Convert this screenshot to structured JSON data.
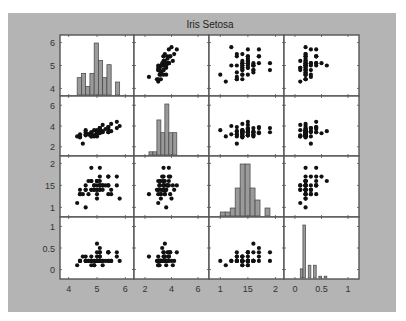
{
  "figure": {
    "title": "Iris Setosa",
    "background": "#b4b4b4",
    "axes_background": "#ffffff",
    "axis_color": "#555555",
    "marker_color": "#111111",
    "bar_fill": "#9a9a9a",
    "bar_stroke": "#444444"
  },
  "chart_data": {
    "type": "scatter",
    "subtype": "scatter-plot-matrix",
    "title": "Iris Setosa",
    "variables": [
      "sepal length",
      "sepal width",
      "petal length",
      "petal width"
    ],
    "diagonal": "histogram",
    "grid": false,
    "axes": [
      {
        "name": "var1",
        "range": [
          3.8,
          6.2
        ],
        "ticks": [
          4,
          5,
          6
        ],
        "tick_labels": [
          "4",
          "5",
          "6"
        ]
      },
      {
        "name": "var2",
        "range": [
          1.4,
          6.6
        ],
        "ticks": [
          2,
          4,
          6
        ],
        "tick_labels": [
          "2",
          "4",
          "6"
        ]
      },
      {
        "name": "var3",
        "range": [
          0.85,
          2.1
        ],
        "ticks": [
          1,
          1.5,
          2
        ],
        "tick_labels": [
          "1",
          "15",
          "2"
        ]
      },
      {
        "name": "var4",
        "range": [
          -0.15,
          1.15
        ],
        "ticks": [
          0,
          0.5,
          1
        ],
        "tick_labels": [
          "0",
          "0.5",
          "1"
        ]
      }
    ],
    "histograms": [
      {
        "var": 0,
        "bin_edges": [
          4.3,
          4.45,
          4.6,
          4.75,
          4.9,
          5.05,
          5.2,
          5.35,
          5.5,
          5.65,
          5.8
        ],
        "counts": [
          4,
          5,
          2,
          5,
          12,
          8,
          4,
          7,
          0,
          3
        ]
      },
      {
        "var": 1,
        "bin_edges": [
          2.3,
          2.6,
          2.9,
          3.2,
          3.5,
          3.8,
          4.1,
          4.4
        ],
        "counts": [
          1,
          1,
          11,
          7,
          16,
          7,
          7,
          2
        ]
      },
      {
        "var": 2,
        "bin_edges": [
          1.0,
          1.09,
          1.18,
          1.27,
          1.36,
          1.45,
          1.54,
          1.63,
          1.72,
          1.81,
          1.9
        ],
        "counts": [
          1,
          1,
          2,
          7,
          13,
          13,
          7,
          4,
          0,
          2
        ]
      },
      {
        "var": 3,
        "bin_edges": [
          0.1,
          0.15,
          0.2,
          0.25,
          0.3,
          0.35,
          0.4,
          0.45,
          0.5,
          0.55,
          0.6
        ],
        "counts": [
          5,
          29,
          0,
          7,
          0,
          7,
          0,
          1,
          0,
          1
        ]
      }
    ],
    "points": [
      [
        5.1,
        3.5,
        1.4,
        0.2
      ],
      [
        4.9,
        3.0,
        1.4,
        0.2
      ],
      [
        4.7,
        3.2,
        1.3,
        0.2
      ],
      [
        4.6,
        3.1,
        1.5,
        0.2
      ],
      [
        5.0,
        3.6,
        1.4,
        0.2
      ],
      [
        5.4,
        3.9,
        1.7,
        0.4
      ],
      [
        4.6,
        3.4,
        1.4,
        0.3
      ],
      [
        5.0,
        3.4,
        1.5,
        0.2
      ],
      [
        4.4,
        2.9,
        1.4,
        0.2
      ],
      [
        4.9,
        3.1,
        1.5,
        0.1
      ],
      [
        5.4,
        3.7,
        1.5,
        0.2
      ],
      [
        4.8,
        3.4,
        1.6,
        0.2
      ],
      [
        4.8,
        3.0,
        1.4,
        0.1
      ],
      [
        4.3,
        3.0,
        1.1,
        0.1
      ],
      [
        5.8,
        4.0,
        1.2,
        0.2
      ],
      [
        5.7,
        4.4,
        1.5,
        0.4
      ],
      [
        5.4,
        3.9,
        1.3,
        0.4
      ],
      [
        5.1,
        3.5,
        1.4,
        0.3
      ],
      [
        5.7,
        3.8,
        1.7,
        0.3
      ],
      [
        5.1,
        3.8,
        1.5,
        0.3
      ],
      [
        5.4,
        3.4,
        1.7,
        0.2
      ],
      [
        5.1,
        3.7,
        1.5,
        0.4
      ],
      [
        4.6,
        3.6,
        1.0,
        0.2
      ],
      [
        5.1,
        3.3,
        1.7,
        0.5
      ],
      [
        4.8,
        3.4,
        1.9,
        0.2
      ],
      [
        5.0,
        3.0,
        1.6,
        0.2
      ],
      [
        5.0,
        3.4,
        1.6,
        0.4
      ],
      [
        5.2,
        3.5,
        1.5,
        0.2
      ],
      [
        5.2,
        3.4,
        1.4,
        0.2
      ],
      [
        4.7,
        3.2,
        1.6,
        0.2
      ],
      [
        4.8,
        3.1,
        1.6,
        0.2
      ],
      [
        5.4,
        3.4,
        1.5,
        0.4
      ],
      [
        5.2,
        4.1,
        1.5,
        0.1
      ],
      [
        5.5,
        4.2,
        1.4,
        0.2
      ],
      [
        4.9,
        3.1,
        1.5,
        0.2
      ],
      [
        5.0,
        3.2,
        1.2,
        0.2
      ],
      [
        5.5,
        3.5,
        1.3,
        0.2
      ],
      [
        4.9,
        3.6,
        1.4,
        0.1
      ],
      [
        4.4,
        3.0,
        1.3,
        0.2
      ],
      [
        5.1,
        3.4,
        1.5,
        0.2
      ],
      [
        5.0,
        3.5,
        1.3,
        0.3
      ],
      [
        4.5,
        2.3,
        1.3,
        0.3
      ],
      [
        4.4,
        3.2,
        1.3,
        0.2
      ],
      [
        5.0,
        3.5,
        1.6,
        0.6
      ],
      [
        5.1,
        3.8,
        1.9,
        0.4
      ],
      [
        4.8,
        3.0,
        1.4,
        0.3
      ],
      [
        5.1,
        3.8,
        1.6,
        0.2
      ],
      [
        4.6,
        3.2,
        1.4,
        0.2
      ],
      [
        5.3,
        3.7,
        1.5,
        0.2
      ],
      [
        5.0,
        3.3,
        1.4,
        0.2
      ]
    ],
    "xlabel": "",
    "ylabel": "",
    "legend": null
  },
  "layout": {
    "col_edges": [
      60,
      134,
      209,
      284,
      359
    ],
    "row_edges": [
      35,
      96,
      156,
      217,
      279
    ]
  }
}
